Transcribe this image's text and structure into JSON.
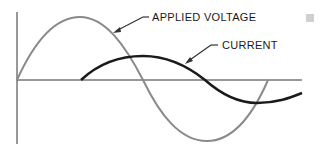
{
  "diagram": {
    "labels": {
      "voltage": "APPLIED VOLTAGE",
      "current": "CURRENT",
      "corner_mark": "IIII"
    },
    "colors": {
      "voltage": "#8a8a8a",
      "current": "#1a1a1a",
      "axis": "#333333"
    },
    "series": [
      {
        "name": "APPLIED VOLTAGE",
        "shape": "sine",
        "start_x": 17,
        "peak": [
          80,
          17
        ],
        "zero_cross": 143,
        "trough": [
          207,
          141
        ],
        "end_x": 268
      },
      {
        "name": "CURRENT",
        "shape": "lagging sine",
        "start_x": 81,
        "peak": [
          143,
          56
        ],
        "zero_cross": 205,
        "trough": [
          257,
          103
        ],
        "end": [
          302,
          93
        ]
      }
    ]
  }
}
